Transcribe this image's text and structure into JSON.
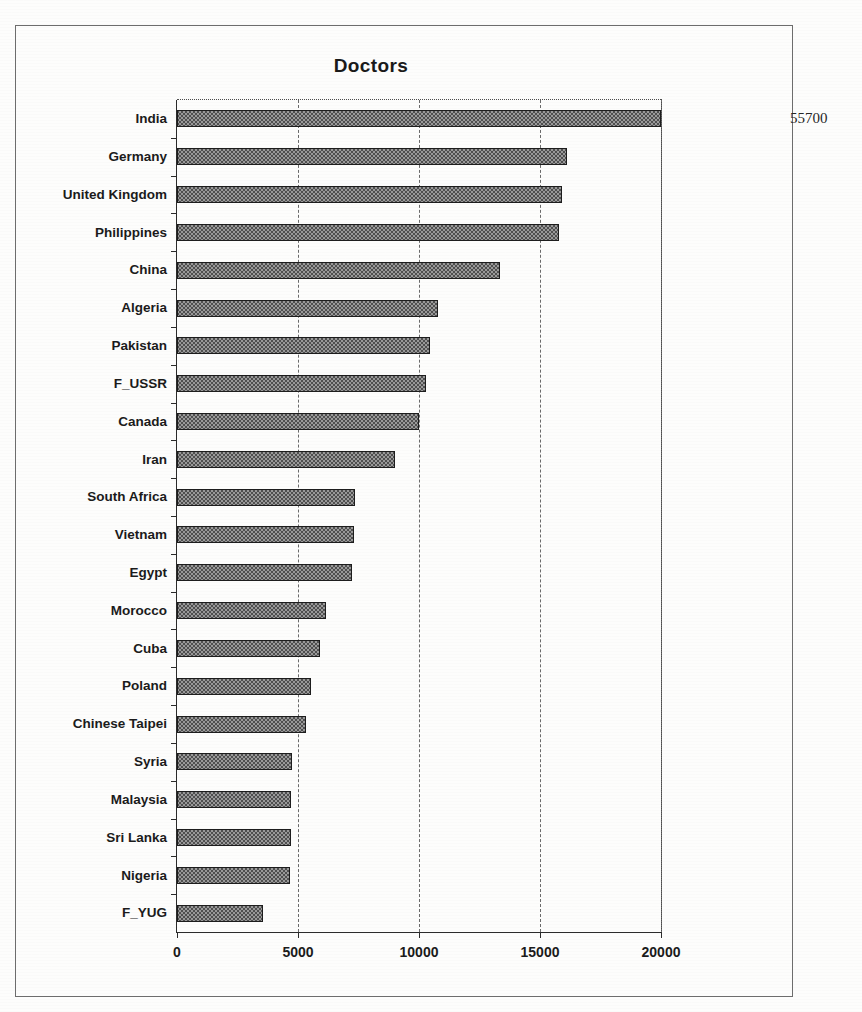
{
  "chart_data": {
    "type": "bar",
    "orientation": "horizontal",
    "title": "Doctors",
    "xlabel": "",
    "ylabel": "",
    "xlim": [
      0,
      20000
    ],
    "grid": true,
    "legend": null,
    "xticks": [
      "0",
      "5000",
      "10000",
      "15000",
      "20000"
    ],
    "xtick_values": [
      0,
      5000,
      10000,
      15000,
      20000
    ],
    "categories": [
      "India",
      "Germany",
      "United Kingdom",
      "Philippines",
      "China",
      "Algeria",
      "Pakistan",
      "F_USSR",
      "Canada",
      "Iran",
      "South Africa",
      "Vietnam",
      "Egypt",
      "Morocco",
      "Cuba",
      "Poland",
      "Chinese Taipei",
      "Syria",
      "Malaysia",
      "Sri Lanka",
      "Nigeria",
      "F_YUG"
    ],
    "values": [
      55700,
      16100,
      15900,
      15800,
      13350,
      10800,
      10450,
      10300,
      10000,
      9000,
      7350,
      7300,
      7250,
      6150,
      5900,
      5550,
      5350,
      4750,
      4700,
      4700,
      4650,
      3550
    ],
    "data_labels": [
      {
        "category": "India",
        "text": "55700"
      }
    ],
    "overflow_note": "India bar exceeds the 20000 axis maximum and is drawn clipped past the plot frame"
  }
}
